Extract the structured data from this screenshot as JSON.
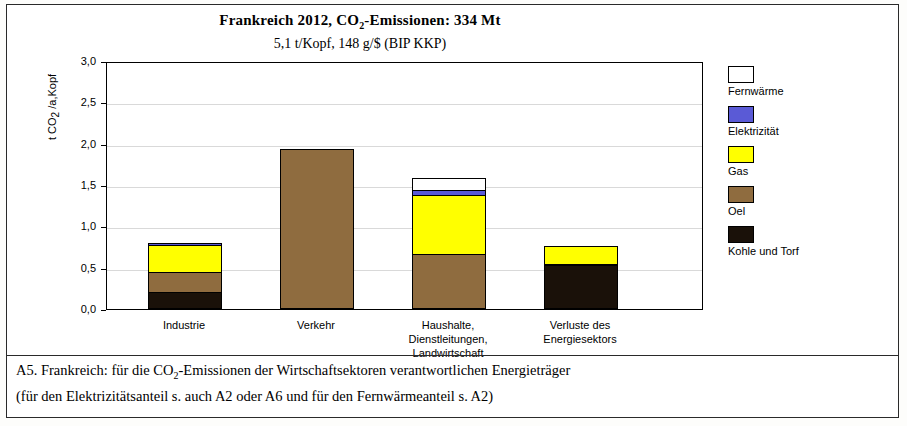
{
  "chart_data": {
    "type": "bar",
    "stacked": true,
    "title": "Frankreich  2012, CO2-Emissionen:  334 Mt",
    "title_parts": {
      "pre": "Frankreich  2012, CO",
      "sub": "2",
      "post": "-Emissionen:  334 Mt"
    },
    "subtitle": "5,1 t/Kopf,    148 g/$  (BIP KKP)",
    "ylabel": "t CO2 /a,Kopf",
    "ylabel_parts": {
      "pre": "t CO",
      "sub": "2",
      "post": " /a,Kopf"
    },
    "xlabel": "",
    "ylim": [
      0,
      3.0
    ],
    "yticks": [
      "0,0",
      "0,5",
      "1,0",
      "1,5",
      "2,0",
      "2,5",
      "3,0"
    ],
    "ytick_values": [
      0,
      0.5,
      1.0,
      1.5,
      2.0,
      2.5,
      3.0
    ],
    "grid": true,
    "legend_position": "right",
    "categories": [
      "Industrie",
      "Verkehr",
      "Haushalte,\nDienstleitungen,\nLandwirtschaft",
      "Verluste des\nEnergiesektors"
    ],
    "category_lines": [
      [
        "Industrie"
      ],
      [
        "Verkehr"
      ],
      [
        "Haushalte,",
        "Dienstleitungen,",
        "Landwirtschaft"
      ],
      [
        "Verluste des",
        "Energiesektors"
      ]
    ],
    "series": [
      {
        "name": "Kohle und Torf",
        "color": "#1a1109",
        "values": [
          0.2,
          0.0,
          0.0,
          0.53
        ]
      },
      {
        "name": "Oel",
        "color": "#8f6c3f",
        "values": [
          0.25,
          1.94,
          0.66,
          0.02
        ]
      },
      {
        "name": "Gas",
        "color": "#ffff00",
        "values": [
          0.33,
          0.0,
          0.72,
          0.21
        ]
      },
      {
        "name": "Elektrizität",
        "color": "#5a5ad6",
        "values": [
          0.02,
          0.0,
          0.06,
          0.0
        ]
      },
      {
        "name": "Fernwärme",
        "color": "#ffffff",
        "values": [
          0.0,
          0.0,
          0.15,
          0.0
        ]
      }
    ],
    "totals": [
      0.8,
      1.94,
      1.59,
      0.76
    ]
  },
  "legend": {
    "items": [
      {
        "label": "Fernwärme",
        "color": "#ffffff"
      },
      {
        "label": "Elektrizität",
        "color": "#5a5ad6"
      },
      {
        "label": "Gas",
        "color": "#ffff00"
      },
      {
        "label": "Oel",
        "color": "#8f6c3f"
      },
      {
        "label": "Kohle und Torf",
        "color": "#1a1109"
      }
    ]
  },
  "caption": {
    "line1_pre": "A5.  Frankreich:  für die CO",
    "line1_sub": "2",
    "line1_post": "-Emissionen der Wirtschaftsektoren verantwortlichen Energieträger",
    "line2": "(für den Elektrizitätsanteil s. auch A2 oder A6 und für den Fernwärmeanteil s. A2)"
  }
}
